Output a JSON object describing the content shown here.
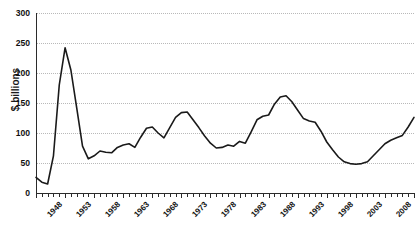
{
  "chart_data": {
    "type": "line",
    "title": "",
    "xlabel": "",
    "ylabel": "$ billions",
    "ylim": [
      0,
      300
    ],
    "ytick_values": [
      0,
      50,
      100,
      150,
      200,
      250,
      300
    ],
    "ytick_labels": [
      "0",
      "50",
      "100",
      "150",
      "200",
      "250",
      "300"
    ],
    "xlim": [
      1948,
      2013
    ],
    "xtick_labels": [
      "1948",
      "1953",
      "1958",
      "1963",
      "1968",
      "1973",
      "1978",
      "1983",
      "1988",
      "1993",
      "1998",
      "2003",
      "2008",
      "2013"
    ],
    "xtick_values": [
      1948,
      1953,
      1958,
      1963,
      1968,
      1973,
      1978,
      1983,
      1988,
      1993,
      1998,
      2003,
      2008,
      2013
    ],
    "xtick_rotation": -45,
    "minor_xticks": "annual",
    "grid": "horizontal-dotted",
    "legend": "none",
    "line_color": "#1a1a1a",
    "line_width": 1.6,
    "series": [
      {
        "name": "",
        "x": [
          1948,
          1949,
          1950,
          1951,
          1952,
          1953,
          1954,
          1955,
          1956,
          1957,
          1958,
          1959,
          1960,
          1961,
          1962,
          1963,
          1964,
          1965,
          1966,
          1967,
          1968,
          1969,
          1970,
          1971,
          1972,
          1973,
          1974,
          1975,
          1976,
          1977,
          1978,
          1979,
          1980,
          1981,
          1982,
          1983,
          1984,
          1985,
          1986,
          1987,
          1988,
          1989,
          1990,
          1991,
          1992,
          1993,
          1994,
          1995,
          1996,
          1997,
          1998,
          1999,
          2000,
          2001,
          2002,
          2003,
          2004,
          2005,
          2006,
          2007,
          2008,
          2009,
          2010,
          2011,
          2012,
          2013
        ],
        "y": [
          26,
          18,
          15,
          62,
          180,
          242,
          205,
          142,
          78,
          57,
          62,
          70,
          68,
          67,
          76,
          80,
          82,
          76,
          93,
          108,
          110,
          100,
          92,
          109,
          126,
          134,
          135,
          122,
          109,
          95,
          83,
          75,
          76,
          80,
          78,
          86,
          83,
          102,
          122,
          128,
          130,
          148,
          160,
          162,
          152,
          138,
          124,
          120,
          118,
          103,
          85,
          72,
          60,
          52,
          49,
          48,
          49,
          52,
          62,
          72,
          82,
          88,
          92,
          96,
          110,
          126
        ]
      }
    ],
    "series_detail_note": "peak 242 near 1953; secondary peaks 135 (1974), 162 (1991 region), 133 (2009)"
  },
  "axis": {
    "y_title": "$ billions"
  }
}
